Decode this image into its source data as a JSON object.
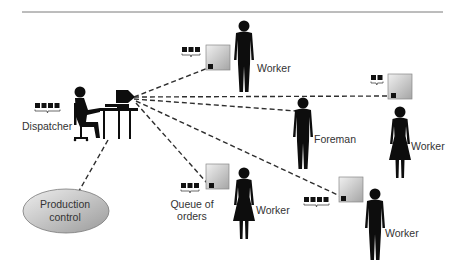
{
  "diagram": {
    "title": "",
    "nodes": {
      "dispatcher": {
        "label": "Dispatcher"
      },
      "production_control": {
        "label_line1": "Production",
        "label_line2": "control"
      },
      "queue_label": {
        "line1": "Queue of",
        "line2": "orders"
      },
      "worker_top": {
        "label": "Worker"
      },
      "worker_right": {
        "label": "Worker"
      },
      "foreman": {
        "label": "Foreman"
      },
      "worker_bottom_mid": {
        "label": "Worker"
      },
      "worker_bottom_right": {
        "label": "Worker"
      }
    },
    "queues": {
      "dispatcher_queue_count": 4,
      "top_machine_queue_count": 3,
      "right_machine_queue_count": 2,
      "mid_machine_queue_count": 3,
      "bottom_right_machine_queue_count": 4
    },
    "colors": {
      "figure": "#0d0d0d",
      "line": "#333333",
      "machine_fill_light": "#ededed",
      "machine_fill_dark": "#a8a8a8",
      "ellipse_fill_light": "#e8e8e8",
      "ellipse_fill_dark": "#a0a0a0"
    }
  }
}
